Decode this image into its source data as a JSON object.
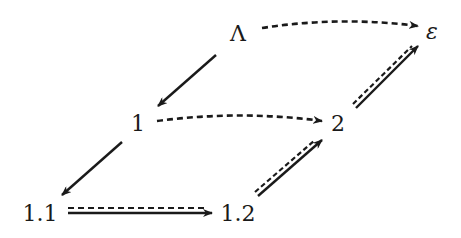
{
  "diagram": {
    "nodes": [
      {
        "id": "lambda",
        "label": "Λ",
        "x": 238,
        "y": 34
      },
      {
        "id": "epsilon",
        "label": "ε",
        "x": 432,
        "y": 34
      },
      {
        "id": "n1",
        "label": "1",
        "x": 138,
        "y": 124
      },
      {
        "id": "n2",
        "label": "2",
        "x": 338,
        "y": 124
      },
      {
        "id": "n11",
        "label": "1.1",
        "x": 40,
        "y": 214
      },
      {
        "id": "n12",
        "label": "1.2",
        "x": 238,
        "y": 214
      }
    ],
    "edges": [
      {
        "from": "lambda",
        "to": "n1",
        "style": "solid"
      },
      {
        "from": "n1",
        "to": "n11",
        "style": "solid"
      },
      {
        "from": "lambda",
        "to": "epsilon",
        "style": "dashed-curved"
      },
      {
        "from": "n1",
        "to": "n2",
        "style": "dashed-curved"
      },
      {
        "from": "n11",
        "to": "n12",
        "style": "solid+dashed"
      },
      {
        "from": "n12",
        "to": "n2",
        "style": "solid+dashed"
      },
      {
        "from": "n2",
        "to": "epsilon",
        "style": "solid+dashed"
      }
    ],
    "colors": {
      "ink": "#1a1a1a",
      "background": "#ffffff"
    }
  }
}
